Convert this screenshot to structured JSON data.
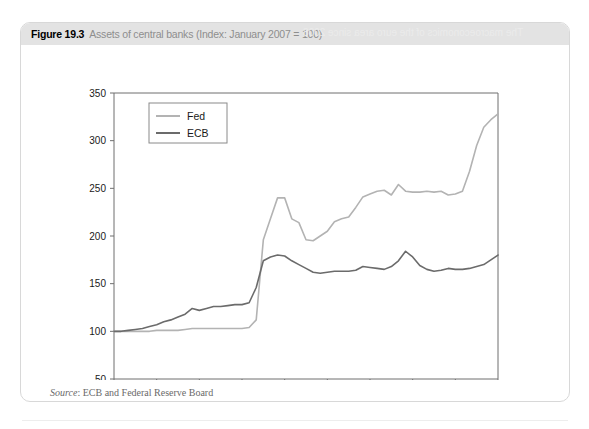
{
  "figure": {
    "number": "Figure 19.3",
    "caption": "Assets of central banks (Index: January 2007 = 100)",
    "bleed_text": "The macroeconomics of the euro area since 2008",
    "source_label": "Source",
    "source_text": ": ECB and Federal Reserve Board"
  },
  "colors": {
    "fed_line": "#b3b3b3",
    "ecb_line": "#6b6b6b",
    "axis": "#6f6f6f",
    "header_bar": "#e3e3e3",
    "caption_gray": "#8e8e8e"
  },
  "chart_data": {
    "type": "line",
    "title": "Assets of central banks (Index: January 2007 = 100)",
    "xlabel": "",
    "ylabel": "",
    "grid": false,
    "legend_position": "top-left",
    "ylim": [
      50,
      350
    ],
    "yticks": [
      50,
      100,
      150,
      200,
      250,
      300,
      350
    ],
    "xticks": [
      "2007-01",
      "2007-07",
      "2008-01",
      "2008-07",
      "2009-01",
      "2009-07",
      "2010-01",
      "2010-07",
      "2011-01",
      "2011-07"
    ],
    "x": [
      "2007-01",
      "2007-02",
      "2007-03",
      "2007-04",
      "2007-05",
      "2007-06",
      "2007-07",
      "2007-08",
      "2007-09",
      "2007-10",
      "2007-11",
      "2007-12",
      "2008-01",
      "2008-02",
      "2008-03",
      "2008-04",
      "2008-05",
      "2008-06",
      "2008-07",
      "2008-08",
      "2008-09",
      "2008-10",
      "2008-11",
      "2008-12",
      "2009-01",
      "2009-02",
      "2009-03",
      "2009-04",
      "2009-05",
      "2009-06",
      "2009-07",
      "2009-08",
      "2009-09",
      "2009-10",
      "2009-11",
      "2009-12",
      "2010-01",
      "2010-02",
      "2010-03",
      "2010-04",
      "2010-05",
      "2010-06",
      "2010-07",
      "2010-08",
      "2010-09",
      "2010-10",
      "2010-11",
      "2010-12",
      "2011-01",
      "2011-02",
      "2011-03",
      "2011-04",
      "2011-05",
      "2011-06",
      "2011-07"
    ],
    "series": [
      {
        "name": "Fed",
        "color": "#b3b3b3",
        "values": [
          100,
          100,
          100,
          100,
          100,
          100,
          101,
          101,
          101,
          101,
          102,
          103,
          103,
          103,
          103,
          103,
          103,
          103,
          103,
          104,
          112,
          196,
          218,
          240,
          240,
          218,
          214,
          196,
          195,
          200,
          205,
          215,
          218,
          220,
          230,
          241,
          244,
          247,
          248,
          243,
          254,
          247,
          246,
          246,
          247,
          246,
          247,
          243,
          244,
          247,
          268,
          295,
          314,
          322,
          328
        ]
      },
      {
        "name": "ECB",
        "color": "#6b6b6b",
        "values": [
          100,
          100,
          101,
          102,
          103,
          105,
          107,
          110,
          112,
          115,
          118,
          124,
          122,
          124,
          126,
          126,
          127,
          128,
          128,
          130,
          146,
          174,
          178,
          180,
          179,
          174,
          170,
          166,
          162,
          161,
          162,
          163,
          163,
          163,
          164,
          168,
          167,
          166,
          165,
          168,
          174,
          184,
          178,
          169,
          165,
          163,
          164,
          166,
          165,
          165,
          166,
          168,
          170,
          175,
          180
        ]
      }
    ]
  }
}
